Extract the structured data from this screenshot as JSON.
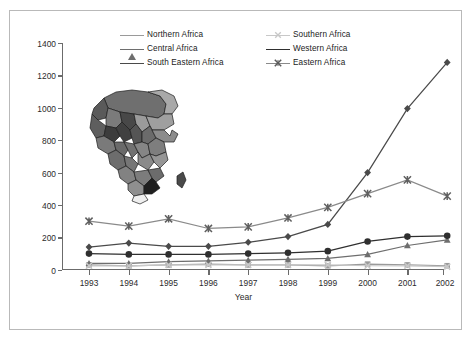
{
  "chart_data": {
    "type": "line",
    "title": "",
    "xlabel": "Year",
    "ylabel": "",
    "categories": [
      "1993",
      "1994",
      "1995",
      "1996",
      "1997",
      "1998",
      "1999",
      "2000",
      "2001",
      "2002"
    ],
    "ylim": [
      0,
      1400
    ],
    "yticks": [
      0,
      200,
      400,
      600,
      800,
      1000,
      1200,
      1400
    ],
    "grid": false,
    "legend_position": "top-center",
    "series": [
      {
        "name": "Northern Africa",
        "marker": "square",
        "color": "#9a9a9a",
        "values": [
          30,
          25,
          30,
          35,
          30,
          30,
          25,
          35,
          30,
          25
        ]
      },
      {
        "name": "Central Africa",
        "marker": "triangle",
        "color": "#6e6e6e",
        "values": [
          40,
          40,
          50,
          55,
          60,
          65,
          70,
          95,
          150,
          185
        ]
      },
      {
        "name": "South Eastern Africa",
        "marker": "diamond",
        "color": "#4a4a4a",
        "values": [
          140,
          165,
          145,
          145,
          170,
          205,
          280,
          600,
          995,
          1280
        ]
      },
      {
        "name": "Southern Africa",
        "marker": "x-light",
        "color": "#c8c8c8",
        "values": [
          25,
          25,
          30,
          30,
          30,
          30,
          30,
          25,
          25,
          20
        ]
      },
      {
        "name": "Western Africa",
        "marker": "circle",
        "color": "#2f2f2f",
        "values": [
          100,
          95,
          95,
          95,
          100,
          105,
          115,
          175,
          205,
          210
        ]
      },
      {
        "name": "Eastern Africa",
        "marker": "x-cross",
        "color": "#8a8a8a",
        "values": [
          300,
          270,
          315,
          255,
          265,
          320,
          385,
          470,
          555,
          455
        ]
      }
    ]
  },
  "axes": {
    "y_tick_labels": [
      "1400",
      "1200",
      "1000",
      "800",
      "600",
      "400",
      "200",
      "0"
    ],
    "x_tick_labels": [
      "1993",
      "1994",
      "1995",
      "1996",
      "1997",
      "1998",
      "1999",
      "2000",
      "2001",
      "2002"
    ],
    "x_axis_title": "Year"
  },
  "legend": {
    "column_left": [
      {
        "label": "Northern Africa",
        "marker": "square",
        "color": "#9a9a9a"
      },
      {
        "label": "Central Africa",
        "marker": "triangle",
        "color": "#6e6e6e"
      },
      {
        "label": "South Eastern Africa",
        "marker": "diamond",
        "color": "#4a4a4a"
      }
    ],
    "column_right": [
      {
        "label": "Southern Africa",
        "marker": "x-light",
        "color": "#c8c8c8"
      },
      {
        "label": "Western Africa",
        "marker": "circle",
        "color": "#2f2f2f"
      },
      {
        "label": "Eastern Africa",
        "marker": "x-cross",
        "color": "#8a8a8a"
      }
    ]
  },
  "inset": {
    "name": "africa-map-inset",
    "description": "Grayscale map of Africa with shaded country regions"
  },
  "colors": {
    "frame": "#b9b9b9",
    "axis": "#6b6b6b",
    "background": "#ffffff",
    "text": "#1a1a1a"
  }
}
